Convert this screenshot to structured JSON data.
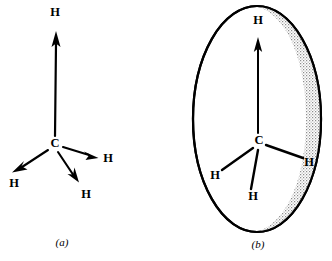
{
  "figure": {
    "background_color": "#ffffff",
    "ink_color": "#000000",
    "stipple_color": "#9a9a9a",
    "width": 332,
    "height": 261
  },
  "panels": [
    {
      "id": "a",
      "caption": "(a)",
      "caption_x": 62,
      "caption_y": 243,
      "center_atom": {
        "label": "C",
        "x": 55,
        "y": 144
      },
      "bonds": [
        {
          "label": "H",
          "label_x": 55,
          "label_y": 13,
          "tip_x": 56,
          "tip_y": 31,
          "tail_x": 55,
          "tail_y": 136,
          "head_len": 17,
          "head_w": 7,
          "shaft_w": 2.2,
          "direction": "up"
        },
        {
          "label": "H",
          "label_x": 14,
          "label_y": 184,
          "tip_x": 12,
          "tip_y": 172,
          "tail_x": 48,
          "tail_y": 150,
          "head_len": 13,
          "head_w": 6,
          "shaft_w": 2.0,
          "direction": "down-left"
        },
        {
          "label": "H",
          "label_x": 86,
          "label_y": 195,
          "tip_x": 79,
          "tip_y": 182,
          "tail_x": 58,
          "tail_y": 152,
          "head_len": 13,
          "head_w": 6,
          "shaft_w": 2.0,
          "direction": "down-right-short"
        },
        {
          "label": "H",
          "label_x": 108,
          "label_y": 159,
          "tip_x": 97,
          "tip_y": 158,
          "tail_x": 63,
          "tail_y": 147,
          "head_len": 13,
          "head_w": 6,
          "shaft_w": 2.0,
          "direction": "right"
        }
      ]
    },
    {
      "id": "b",
      "caption": "(b)",
      "caption_x": 258,
      "caption_y": 245,
      "center_atom": {
        "label": "C",
        "x": 259,
        "y": 141
      },
      "ellipse": {
        "cx": 257,
        "cy": 119,
        "rx": 64,
        "ry": 113,
        "stroke_width": 2.2
      },
      "arrow": {
        "label": "H",
        "label_x": 258,
        "label_y": 21,
        "tip_x": 258,
        "tip_y": 37,
        "tail_x": 258,
        "tail_y": 133,
        "head_len": 15,
        "head_w": 6.5,
        "shaft_w": 2.0
      },
      "bonds": [
        {
          "label": "H",
          "label_x": 215,
          "label_y": 176,
          "end_x": 222,
          "end_y": 170,
          "start_x": 253,
          "start_y": 148,
          "stroke_w": 2.4
        },
        {
          "label": "H",
          "label_x": 253,
          "label_y": 197,
          "end_x": 251,
          "end_y": 189,
          "start_x": 258,
          "start_y": 150,
          "stroke_w": 2.4
        },
        {
          "label": "H",
          "label_x": 309,
          "label_y": 163,
          "end_x": 303,
          "end_y": 158,
          "start_x": 266,
          "start_y": 145,
          "stroke_w": 2.4
        }
      ]
    }
  ]
}
